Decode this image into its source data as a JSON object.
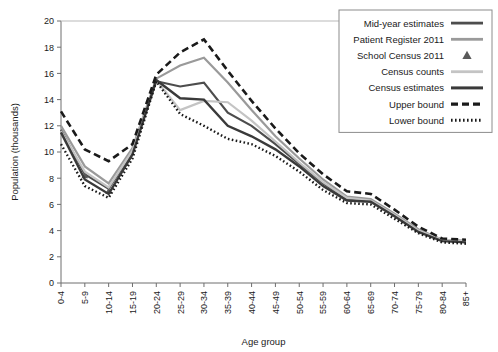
{
  "chart_data": {
    "type": "line",
    "title": "",
    "xlabel": "Age group",
    "ylabel": "Population (thousands)",
    "ylim": [
      0,
      20
    ],
    "yticks": [
      0,
      2,
      4,
      6,
      8,
      10,
      12,
      14,
      16,
      18,
      20
    ],
    "grid": false,
    "legend_position": "top-right",
    "categories": [
      "0-4",
      "5-9",
      "10-14",
      "15-19",
      "20-24",
      "25-29",
      "30-34",
      "35-39",
      "40-44",
      "45-49",
      "50-54",
      "55-59",
      "60-64",
      "65-69",
      "70-74",
      "75-79",
      "80-84",
      "85+"
    ],
    "series": [
      {
        "name": "Mid-year estimates",
        "style": "solid",
        "color": "#4d4d4d",
        "width": 2.2,
        "values": [
          11.7,
          8.3,
          7.2,
          10.0,
          15.4,
          15.0,
          15.3,
          13.0,
          12.0,
          10.6,
          9.1,
          7.6,
          6.4,
          6.3,
          5.2,
          4.0,
          3.3,
          3.2
        ]
      },
      {
        "name": "Patient Register 2011",
        "style": "solid",
        "color": "#9a9a9a",
        "width": 2.2,
        "values": [
          12.0,
          8.9,
          7.6,
          10.3,
          15.6,
          16.6,
          17.2,
          15.3,
          13.2,
          11.2,
          9.5,
          7.9,
          6.6,
          6.4,
          5.3,
          4.1,
          3.3,
          3.2
        ]
      },
      {
        "name": "School Census 2011",
        "style": "marker",
        "marker": "triangle",
        "color": "#5a5a5a",
        "width": 0,
        "values": [
          null,
          8.2,
          7.0,
          null,
          null,
          null,
          null,
          null,
          null,
          null,
          null,
          null,
          null,
          null,
          null,
          null,
          null,
          null
        ]
      },
      {
        "name": "Census counts",
        "style": "solid",
        "color": "#c4c4c4",
        "width": 2.2,
        "values": [
          11.6,
          8.5,
          7.3,
          10.1,
          15.5,
          13.2,
          13.9,
          13.8,
          12.4,
          10.8,
          9.2,
          7.7,
          6.5,
          6.3,
          5.2,
          4.0,
          3.3,
          3.2
        ]
      },
      {
        "name": "Census estimates",
        "style": "solid",
        "color": "#3a3a3a",
        "width": 2.4,
        "values": [
          11.5,
          7.9,
          6.8,
          9.8,
          15.5,
          14.1,
          14.0,
          12.0,
          11.2,
          10.2,
          8.9,
          7.4,
          6.3,
          6.2,
          5.1,
          3.9,
          3.2,
          3.1
        ]
      },
      {
        "name": "Upper bound",
        "style": "dashed",
        "color": "#1a1a1a",
        "width": 2.6,
        "values": [
          13.1,
          10.2,
          9.3,
          10.6,
          15.9,
          17.6,
          18.6,
          16.2,
          13.9,
          11.8,
          9.9,
          8.3,
          7.0,
          6.8,
          5.6,
          4.3,
          3.4,
          3.3
        ]
      },
      {
        "name": "Lower bound",
        "style": "dotted",
        "color": "#1a1a1a",
        "width": 2.4,
        "values": [
          10.6,
          7.4,
          6.5,
          9.5,
          15.4,
          12.9,
          12.0,
          11.0,
          10.6,
          9.7,
          8.5,
          7.1,
          6.1,
          6.0,
          4.9,
          3.8,
          3.1,
          3.0
        ]
      }
    ]
  }
}
